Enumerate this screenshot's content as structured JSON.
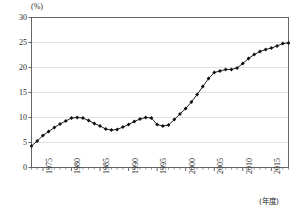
{
  "chart_data": {
    "type": "line",
    "title": "",
    "subtitle": "",
    "xlabel": "(年度)",
    "ylabel": "(%)",
    "ylim": [
      0,
      30
    ],
    "xlim": [
      1973,
      2018
    ],
    "yticks": [
      0,
      5,
      10,
      15,
      20,
      25,
      30
    ],
    "ytick_labels": [
      "0",
      "5",
      "10",
      "15",
      "20",
      "25",
      "30"
    ],
    "xticks": [
      1975,
      1980,
      1985,
      1990,
      1995,
      2000,
      2005,
      2010,
      2015
    ],
    "xtick_labels": [
      "1975",
      "1980",
      "1985",
      "1990",
      "1995",
      "2000",
      "2005",
      "2010",
      "2015"
    ],
    "grid": "horizontal",
    "minor_xticks": "annual",
    "legend": null,
    "marker": "filled-diamond",
    "line_color": "#222222",
    "marker_color": "#111111",
    "grid_color": "#d9d9d9",
    "axis_color": "#555555",
    "x": [
      1973,
      1974,
      1975,
      1976,
      1977,
      1978,
      1979,
      1980,
      1981,
      1982,
      1983,
      1984,
      1985,
      1986,
      1987,
      1988,
      1989,
      1990,
      1991,
      1992,
      1993,
      1994,
      1995,
      1996,
      1997,
      1998,
      1999,
      2000,
      2001,
      2002,
      2003,
      2004,
      2005,
      2006,
      2007,
      2008,
      2009,
      2010,
      2011,
      2012,
      2013,
      2014,
      2015,
      2016,
      2017,
      2018
    ],
    "values": [
      4.3,
      5.3,
      6.4,
      7.2,
      8.0,
      8.7,
      9.3,
      9.9,
      10.0,
      9.9,
      9.4,
      8.8,
      8.3,
      7.7,
      7.5,
      7.6,
      8.1,
      8.6,
      9.2,
      9.7,
      10.0,
      9.9,
      8.6,
      8.3,
      8.5,
      9.6,
      10.7,
      11.8,
      13.1,
      14.6,
      16.2,
      17.8,
      19.0,
      19.3,
      19.6,
      19.6,
      19.9,
      20.8,
      21.8,
      22.6,
      23.2,
      23.6,
      23.9,
      24.3,
      24.8,
      24.9
    ]
  },
  "annotations": {
    "y_unit_text": "(%)",
    "x_unit_text": "(年度)"
  }
}
